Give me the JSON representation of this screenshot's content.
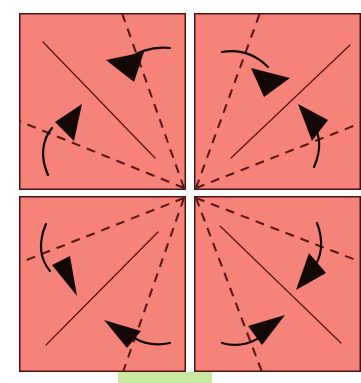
{
  "figure": {
    "kind": "origami-fold-diagram",
    "title": "Origami fold diagram — four square panels with radial fold lines",
    "background_color": "#ffffff",
    "canvas": {
      "width": 361,
      "height": 383
    }
  },
  "colors": {
    "paper_fill": "#F5837A",
    "paper_edge": "#4A1410",
    "fold_line": "#5A1A14",
    "arrow": "#140806",
    "green_tab": "#C9E8A0",
    "gap": "#FFFFFF"
  },
  "panels": [
    {
      "id": "panel-top-left",
      "label": "top-left",
      "x": 19,
      "y": 13,
      "width": 167,
      "height": 177
    },
    {
      "id": "panel-top-right",
      "label": "top-right",
      "x": 194,
      "y": 13,
      "width": 167,
      "height": 177
    },
    {
      "id": "panel-bottom-left",
      "label": "bottom-left",
      "x": 19,
      "y": 196,
      "width": 167,
      "height": 176
    },
    {
      "id": "panel-bottom-right",
      "label": "bottom-right",
      "x": 194,
      "y": 196,
      "width": 167,
      "height": 176
    }
  ],
  "green_tab": {
    "x": 118,
    "y": 372,
    "width": 94,
    "height": 11
  },
  "center_point": {
    "x": 190,
    "y": 193
  },
  "fold_lines": {
    "solid_label": "mountain fold (solid)",
    "dashed_label": "valley fold (dashed)",
    "dash_pattern": "9 7",
    "solid": [
      {
        "id": "solid-tl",
        "panel": "top-left",
        "x1": 43,
        "y1": 42,
        "x2": 155,
        "y2": 158
      },
      {
        "id": "solid-tr",
        "panel": "top-right",
        "x1": 231,
        "y1": 158,
        "x2": 350,
        "y2": 45
      },
      {
        "id": "solid-bl",
        "panel": "bottom-left",
        "x1": 46,
        "y1": 345,
        "x2": 158,
        "y2": 232
      },
      {
        "id": "solid-br",
        "panel": "bottom-right",
        "x1": 220,
        "y1": 226,
        "x2": 341,
        "y2": 343
      }
    ],
    "dashed": [
      {
        "id": "dash-tl-steep",
        "panel": "top-left",
        "x1": 184,
        "y1": 188,
        "x2": 122,
        "y2": 13
      },
      {
        "id": "dash-tl-shallow",
        "panel": "top-left",
        "x1": 184,
        "y1": 188,
        "x2": 19,
        "y2": 121
      },
      {
        "id": "dash-tr-steep",
        "panel": "top-right",
        "x1": 196,
        "y1": 188,
        "x2": 260,
        "y2": 13
      },
      {
        "id": "dash-tr-shallow",
        "panel": "top-right",
        "x1": 196,
        "y1": 188,
        "x2": 361,
        "y2": 123
      },
      {
        "id": "dash-bl-steep",
        "panel": "bottom-left",
        "x1": 184,
        "y1": 198,
        "x2": 123,
        "y2": 372
      },
      {
        "id": "dash-bl-shallow",
        "panel": "bottom-left",
        "x1": 184,
        "y1": 198,
        "x2": 19,
        "y2": 263
      },
      {
        "id": "dash-br-steep",
        "panel": "bottom-right",
        "x1": 196,
        "y1": 198,
        "x2": 262,
        "y2": 372
      },
      {
        "id": "dash-br-shallow",
        "panel": "bottom-right",
        "x1": 196,
        "y1": 198,
        "x2": 361,
        "y2": 262
      }
    ]
  },
  "arrows": [
    {
      "id": "arrow-tl-upper",
      "panel": "top-left",
      "direction": "fold toward upper-left",
      "tail_path": "M 170 48 C 152 46 135 52 124 63",
      "tip": {
        "x": 106,
        "y": 60
      },
      "head_points": "106,60 144,52 134,82"
    },
    {
      "id": "arrow-tl-lower",
      "panel": "top-left",
      "direction": "fold toward upper-right",
      "tail_path": "M 48 175 C 40 157 42 140 52 128",
      "tip": {
        "x": 82,
        "y": 104
      },
      "head_points": "82,104 74,141 55,122"
    },
    {
      "id": "arrow-tr-upper",
      "panel": "top-right",
      "direction": "fold toward upper-right",
      "tail_path": "M 222 52 C 240 49 256 55 268 67",
      "tip": {
        "x": 290,
        "y": 78
      },
      "head_points": "290,78 251,68 264,97"
    },
    {
      "id": "arrow-tr-lower",
      "panel": "top-right",
      "direction": "fold toward upper-left",
      "tail_path": "M 314 167 C 322 149 320 133 311 121",
      "tip": {
        "x": 298,
        "y": 104
      },
      "head_points": "298,104 312,141 328,120"
    },
    {
      "id": "arrow-bl-upper",
      "panel": "bottom-left",
      "direction": "fold toward lower-left",
      "tail_path": "M 46 224 C 38 243 40 259 50 271",
      "tip": {
        "x": 77,
        "y": 296
      },
      "head_points": "77,296 52,265 70,256"
    },
    {
      "id": "arrow-bl-lower",
      "panel": "bottom-left",
      "direction": "fold toward lower-right",
      "tail_path": "M 170 343 C 152 347 136 342 126 331",
      "tip": {
        "x": 104,
        "y": 320
      },
      "head_points": "104,320 141,331 127,348"
    },
    {
      "id": "arrow-br-upper",
      "panel": "bottom-right",
      "direction": "fold toward lower-right",
      "tail_path": "M 317 223 C 324 241 322 258 312 270",
      "tip": {
        "x": 296,
        "y": 290
      },
      "head_points": "296,290 309,253 326,273"
    },
    {
      "id": "arrow-br-lower",
      "panel": "bottom-right",
      "direction": "fold toward lower-left",
      "tail_path": "M 222 343 C 239 348 255 343 266 332",
      "tip": {
        "x": 285,
        "y": 315
      },
      "head_points": "285,315 248,326 262,345"
    }
  ]
}
